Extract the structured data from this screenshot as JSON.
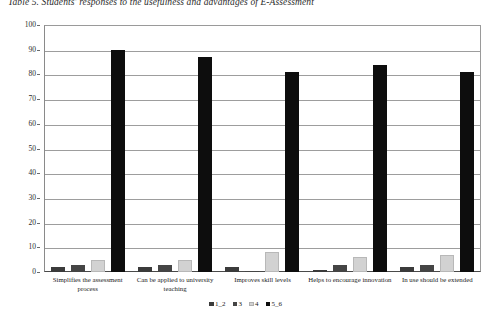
{
  "figure": {
    "caption": "Table 5. Students' responses to the usefulness and advantages of E-Assessment"
  },
  "chart_data": {
    "type": "bar",
    "title": "",
    "xlabel": "",
    "ylabel": "",
    "ylim": [
      0,
      100
    ],
    "yticks": [
      0,
      10,
      20,
      30,
      40,
      50,
      60,
      70,
      80,
      90,
      100
    ],
    "grid": true,
    "legend_position": "bottom",
    "categories": [
      "Simplifies the assessment process",
      "Can be applied to university teaching",
      "Improves skill levels",
      "Helps to encourage innovation",
      "In use should be extended"
    ],
    "series": [
      {
        "name": "1_2",
        "color": "#3b3b3b",
        "values": [
          2,
          2,
          2,
          1,
          2
        ]
      },
      {
        "name": "3",
        "color": "#454545",
        "values": [
          3,
          3,
          0,
          3,
          3
        ]
      },
      {
        "name": "4",
        "color": "#d2d2d2",
        "values": [
          5,
          5,
          8,
          6,
          7
        ]
      },
      {
        "name": "5_6",
        "color": "#0d0d0d",
        "values": [
          90,
          87,
          81,
          84,
          81
        ]
      }
    ]
  },
  "legend": {
    "items": [
      {
        "label": "1_2"
      },
      {
        "label": "3"
      },
      {
        "label": "4"
      },
      {
        "label": "5_6"
      }
    ]
  },
  "yaxis": {
    "labels": [
      "100",
      "90",
      "80",
      "70",
      "60",
      "50",
      "40",
      "30",
      "20",
      "10",
      "0"
    ]
  }
}
